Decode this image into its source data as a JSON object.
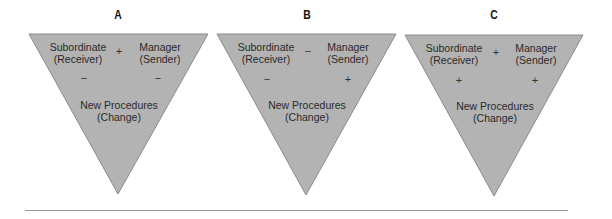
{
  "figure": {
    "fill_color": "#b3b3b3",
    "edge_color": "#8c8c8c",
    "panels": [
      {
        "label": "A",
        "subordinate": "Subordinate",
        "subordinate_role": "(Receiver)",
        "manager": "Manager",
        "manager_role": "(Sender)",
        "change": "New Procedures",
        "change_role": "(Change)",
        "sign_sub_mgr": "+",
        "sign_sub_change": "−",
        "sign_mgr_change": "−"
      },
      {
        "label": "B",
        "subordinate": "Subordinate",
        "subordinate_role": "(Receiver)",
        "manager": "Manager",
        "manager_role": "(Sender)",
        "change": "New Procedures",
        "change_role": "(Change)",
        "sign_sub_mgr": "−",
        "sign_sub_change": "−",
        "sign_mgr_change": "+"
      },
      {
        "label": "C",
        "subordinate": "Subordinate",
        "subordinate_role": "(Receiver)",
        "manager": "Manager",
        "manager_role": "(Sender)",
        "change": "New Procedures",
        "change_role": "(Change)",
        "sign_sub_mgr": "+",
        "sign_sub_change": "+",
        "sign_mgr_change": "+"
      }
    ]
  }
}
